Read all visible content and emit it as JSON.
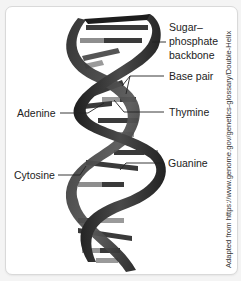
{
  "diagram": {
    "labels": {
      "backbone_line1": "Sugar–",
      "backbone_line2": "phosphate",
      "backbone_line3": "backbone",
      "base_pair": "Base pair",
      "adenine": "Adenine",
      "thymine": "Thymine",
      "cytosine": "Cytosine",
      "guanine": "Guanine"
    },
    "credit": "Adapted from https://www.genome.gov/genetics-glossary/Double-Helix",
    "colors": {
      "background": "#f4f4f4",
      "card": "#ffffff",
      "strand_dark": "#2b2b2b",
      "strand_mid": "#555555",
      "base_dark": "#3a3a3a",
      "base_light": "#9a9a9a",
      "text": "#222222"
    }
  }
}
